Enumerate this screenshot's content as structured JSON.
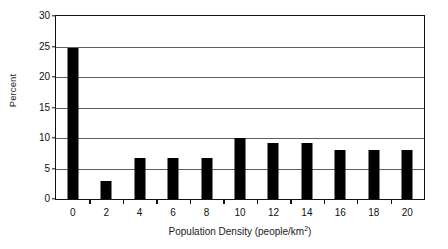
{
  "chart_data": {
    "type": "bar",
    "title": "",
    "xlabel": "Population Density (people/km2)",
    "xlabel_base": "Population Density (people/km",
    "xlabel_sup": "2",
    "xlabel_tail": ")",
    "ylabel": "Percent",
    "categories": [
      "0",
      "2",
      "4",
      "6",
      "8",
      "10",
      "12",
      "14",
      "16",
      "18",
      "20"
    ],
    "values": [
      24.7,
      3.0,
      6.8,
      6.8,
      6.8,
      10.0,
      9.2,
      9.2,
      8.1,
      8.1,
      8.1
    ],
    "ylim": [
      0,
      30
    ],
    "yticks": [
      "0",
      "5",
      "10",
      "15",
      "20",
      "25",
      "30"
    ],
    "ytick_values": [
      0,
      5,
      10,
      15,
      20,
      25,
      30
    ],
    "grid": true,
    "grid_axis": "y",
    "legend": "none",
    "bar_color": "#000000",
    "frame_color": "#111111",
    "grid_color": "#5d5d5d",
    "background": "#ffffff"
  }
}
